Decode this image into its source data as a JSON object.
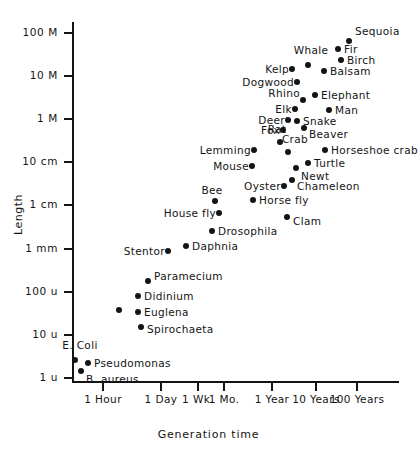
{
  "chart_data": {
    "type": "scatter",
    "title": "",
    "xlabel": "Generation time",
    "ylabel": "Length",
    "grid": false,
    "legend": null,
    "xscale": "log",
    "yscale": "log",
    "x_tick_labels": [
      "1 Hour",
      "1 Day",
      "1 Wk.",
      "1 Mo.",
      "1 Year",
      "10 Years",
      "100 Years"
    ],
    "y_tick_labels": [
      "100 M",
      "10 M",
      "1 M",
      "10 cm",
      "1 cm",
      "1 mm",
      "100 u",
      "10 u",
      "1 u"
    ],
    "points": [
      {
        "label": "Sequoia",
        "x": 349,
        "y": 41,
        "anchor": "right",
        "lx": 355,
        "ly": 31
      },
      {
        "label": "Fir",
        "x": 338,
        "y": 49,
        "anchor": "right",
        "lx": 344,
        "ly": 49
      },
      {
        "label": "Birch",
        "x": 341,
        "y": 60,
        "anchor": "right",
        "lx": 347,
        "ly": 60
      },
      {
        "label": "Whale",
        "x": 308,
        "y": 65,
        "anchor": "above",
        "lx": 311,
        "ly": 56
      },
      {
        "label": "Balsam",
        "x": 324,
        "y": 71,
        "anchor": "right",
        "lx": 330,
        "ly": 71
      },
      {
        "label": "Kelp",
        "x": 292,
        "y": 69,
        "anchor": "left",
        "lx": 289,
        "ly": 69
      },
      {
        "label": "Dogwood",
        "x": 297,
        "y": 82,
        "anchor": "left",
        "lx": 294,
        "ly": 82
      },
      {
        "label": "Elephant",
        "x": 315,
        "y": 95,
        "anchor": "right",
        "lx": 321,
        "ly": 95
      },
      {
        "label": "Rhino",
        "x": 303,
        "y": 100,
        "anchor": "left",
        "lx": 300,
        "ly": 93
      },
      {
        "label": "Elk",
        "x": 295,
        "y": 109,
        "anchor": "left",
        "lx": 292,
        "ly": 109
      },
      {
        "label": "Man",
        "x": 329,
        "y": 110,
        "anchor": "right",
        "lx": 335,
        "ly": 110
      },
      {
        "label": "Deer",
        "x": 288,
        "y": 120,
        "anchor": "left",
        "lx": 285,
        "ly": 120
      },
      {
        "label": "Snake",
        "x": 297,
        "y": 121,
        "anchor": "right",
        "lx": 303,
        "ly": 121
      },
      {
        "label": "Fox",
        "x": 283,
        "y": 130,
        "anchor": "left",
        "lx": 280,
        "ly": 130
      },
      {
        "label": "Beaver",
        "x": 304,
        "y": 128,
        "anchor": "right",
        "lx": 309,
        "ly": 134
      },
      {
        "label": "Rat",
        "x": 280,
        "y": 142,
        "anchor": "above",
        "lx": 277,
        "ly": 135
      },
      {
        "label": "Crab",
        "x": 288,
        "y": 152,
        "anchor": "above",
        "lx": 295,
        "ly": 145
      },
      {
        "label": "Horseshoe crab",
        "x": 325,
        "y": 150,
        "anchor": "right",
        "lx": 331,
        "ly": 150
      },
      {
        "label": "Lemming",
        "x": 254,
        "y": 150,
        "anchor": "left",
        "lx": 251,
        "ly": 150
      },
      {
        "label": "Mouse",
        "x": 252,
        "y": 166,
        "anchor": "left",
        "lx": 249,
        "ly": 166
      },
      {
        "label": "Turtle",
        "x": 308,
        "y": 163,
        "anchor": "right",
        "lx": 314,
        "ly": 163
      },
      {
        "label": "Newt",
        "x": 296,
        "y": 168,
        "anchor": "right",
        "lx": 301,
        "ly": 176
      },
      {
        "label": "Chameleon",
        "x": 292,
        "y": 180,
        "anchor": "right",
        "lx": 297,
        "ly": 186
      },
      {
        "label": "Oyster",
        "x": 284,
        "y": 186,
        "anchor": "left",
        "lx": 281,
        "ly": 186
      },
      {
        "label": "Bee",
        "x": 215,
        "y": 201,
        "anchor": "above",
        "lx": 212,
        "ly": 196
      },
      {
        "label": "Horse fly",
        "x": 253,
        "y": 200,
        "anchor": "right",
        "lx": 259,
        "ly": 200
      },
      {
        "label": "House fly",
        "x": 219,
        "y": 213,
        "anchor": "left",
        "lx": 216,
        "ly": 213
      },
      {
        "label": "Clam",
        "x": 287,
        "y": 217,
        "anchor": "right",
        "lx": 293,
        "ly": 221
      },
      {
        "label": "Drosophila",
        "x": 212,
        "y": 231,
        "anchor": "right",
        "lx": 218,
        "ly": 231
      },
      {
        "label": "Daphnia",
        "x": 186,
        "y": 246,
        "anchor": "right",
        "lx": 192,
        "ly": 246
      },
      {
        "label": "Stentor",
        "x": 168,
        "y": 251,
        "anchor": "left",
        "lx": 165,
        "ly": 251
      },
      {
        "label": "Paramecium",
        "x": 148,
        "y": 281,
        "anchor": "right",
        "lx": 154,
        "ly": 276
      },
      {
        "label": "Didinium",
        "x": 138,
        "y": 296,
        "anchor": "right",
        "lx": 144,
        "ly": 296
      },
      {
        "label": "Euglena",
        "x": 138,
        "y": 312,
        "anchor": "right",
        "lx": 144,
        "ly": 312
      },
      {
        "label": "",
        "x": 119,
        "y": 310,
        "anchor": "right",
        "lx": 125,
        "ly": 310
      },
      {
        "label": "Spirochaeta",
        "x": 141,
        "y": 327,
        "anchor": "right",
        "lx": 147,
        "ly": 329
      },
      {
        "label": "E. Coli",
        "x": 75,
        "y": 360,
        "anchor": "above",
        "lx": 80,
        "ly": 351
      },
      {
        "label": "Pseudomonas",
        "x": 88,
        "y": 363,
        "anchor": "right",
        "lx": 94,
        "ly": 363
      },
      {
        "label": "B. aureus",
        "x": 81,
        "y": 371,
        "anchor": "right",
        "lx": 86,
        "ly": 379
      }
    ]
  },
  "axes": {
    "y_ticks": [
      {
        "label": "100 M",
        "y": 33
      },
      {
        "label": "10 M",
        "y": 76
      },
      {
        "label": "1 M",
        "y": 119
      },
      {
        "label": "10 cm",
        "y": 162
      },
      {
        "label": "1 cm",
        "y": 205
      },
      {
        "label": "1 mm",
        "y": 249
      },
      {
        "label": "100 u",
        "y": 292
      },
      {
        "label": "10 u",
        "y": 335
      },
      {
        "label": "1 u",
        "y": 378
      }
    ],
    "x_ticks": [
      {
        "label": "1 Hour",
        "x": 103
      },
      {
        "label": "1 Day",
        "x": 161
      },
      {
        "label": "1 Wk.",
        "x": 198
      },
      {
        "label": "1 Mo.",
        "x": 224
      },
      {
        "label": "1 Year",
        "x": 272
      },
      {
        "label": "10 Years",
        "x": 316
      },
      {
        "label": "100 Years",
        "x": 357
      }
    ]
  },
  "colors": {
    "ink": "#141414",
    "background": "#ffffff"
  }
}
